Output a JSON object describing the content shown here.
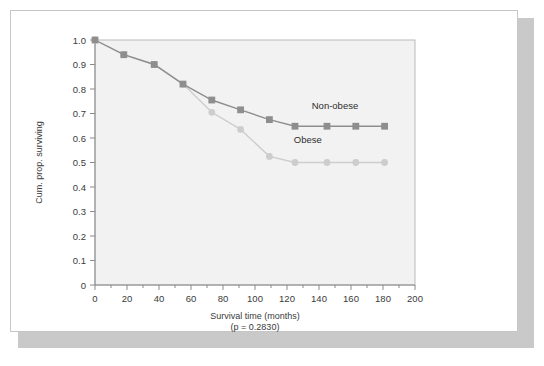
{
  "figure": {
    "background_color": "#ffffff",
    "card_color": "#ffffff",
    "card_border_color": "#c6c6c6",
    "shadow_color": "#c9c9c9",
    "panel_color": "#f2f2f2",
    "panel_border_color": "#b9b9b9"
  },
  "chart_data": {
    "type": "line",
    "title": "",
    "subtitle": "",
    "xlabel": "Survival time (months)",
    "xlabel_sub": "(p = 0.2830)",
    "ylabel": "Cum. prop. surviving",
    "xlim": [
      0,
      200
    ],
    "ylim": [
      0,
      1.0
    ],
    "xticks": [
      0,
      20,
      40,
      60,
      80,
      100,
      120,
      140,
      160,
      180,
      200
    ],
    "xtick_labels": [
      "0",
      "20",
      "40",
      "60",
      "80",
      "100",
      "120",
      "140",
      "160",
      "180",
      "200"
    ],
    "xminor_step": 10,
    "yticks": [
      0,
      0.1,
      0.2,
      0.3,
      0.4,
      0.5,
      0.6,
      0.7,
      0.8,
      0.9,
      1.0
    ],
    "ytick_labels": [
      "0",
      "0.1",
      "0.2",
      "0.3",
      "0.4",
      "0.5",
      "0.6",
      "0.7",
      "0.8",
      "0.9",
      "1.0"
    ],
    "grid": false,
    "legend_position": "inline-annotation",
    "annotations": [
      {
        "text": "Non-obese",
        "x": 150,
        "y": 0.72
      },
      {
        "text": "Obese",
        "x": 133,
        "y": 0.58
      }
    ],
    "series": [
      {
        "name": "Non-obese",
        "marker": "square",
        "color": "#8e8e8e",
        "line_color": "#8e8e8e",
        "x": [
          0,
          18,
          37,
          55,
          73,
          91,
          109,
          125,
          145,
          163,
          181
        ],
        "y": [
          1.0,
          0.94,
          0.9,
          0.82,
          0.755,
          0.715,
          0.675,
          0.648,
          0.648,
          0.648,
          0.648
        ]
      },
      {
        "name": "Obese",
        "marker": "circle",
        "color": "#cdcdcd",
        "line_color": "#cdcdcd",
        "x": [
          0,
          18,
          37,
          55,
          73,
          91,
          109,
          125,
          145,
          163,
          181
        ],
        "y": [
          1.0,
          0.94,
          0.9,
          0.82,
          0.705,
          0.635,
          0.525,
          0.5,
          0.5,
          0.5,
          0.5
        ]
      }
    ]
  }
}
